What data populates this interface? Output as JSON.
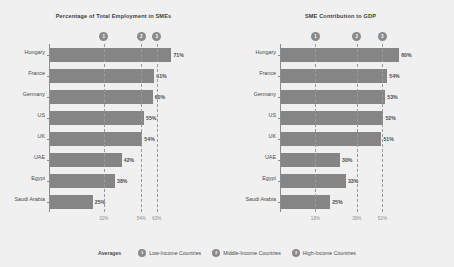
{
  "colors": {
    "background": "#f0f0f0",
    "bar": "#858585",
    "badge": "#8a8a8a",
    "axis": "#8c8c8c",
    "grid": "#9a9a9a",
    "text": "#4a4a4a",
    "tick_text": "#8f8f8f"
  },
  "legend": {
    "title": "Averages",
    "items": [
      {
        "marker": "1",
        "label": "Low-Income Countries"
      },
      {
        "marker": "2",
        "label": "Middle-Income Countries"
      },
      {
        "marker": "3",
        "label": "High-Income Countries"
      }
    ]
  },
  "chart_data": [
    {
      "type": "bar",
      "orientation": "horizontal",
      "title": "Percentage of Total Employment in SMEs",
      "xlabel": "",
      "ylabel": "",
      "xlim": [
        0,
        76
      ],
      "grid": true,
      "legend_position": "bottom",
      "categories": [
        "Hungary",
        "France",
        "Germany",
        "US",
        "UK",
        "UAE",
        "Egypt",
        "Saudi Arabia"
      ],
      "values": [
        71,
        61,
        60,
        55,
        54,
        42,
        38,
        25
      ],
      "value_labels": [
        "71%",
        "61%",
        "60%",
        "55%",
        "54%",
        "42%",
        "38%",
        "25%"
      ],
      "reference_lines": [
        {
          "value": 32,
          "tick_label": "32%",
          "marker": "1"
        },
        {
          "value": 54,
          "tick_label": "54%",
          "marker": "2"
        },
        {
          "value": 63,
          "tick_label": "63%",
          "marker": "3"
        }
      ]
    },
    {
      "type": "bar",
      "orientation": "horizontal",
      "title": "SME Contribution to GDP",
      "xlabel": "",
      "ylabel": "",
      "xlim": [
        0,
        64
      ],
      "grid": true,
      "legend_position": "bottom",
      "categories": [
        "Hungary",
        "France",
        "Germany",
        "US",
        "UK",
        "UAE",
        "Egypt",
        "Saudi Arabia"
      ],
      "values": [
        60,
        54,
        53,
        52,
        51,
        30,
        33,
        25
      ],
      "value_labels": [
        "60%",
        "54%",
        "53%",
        "52%",
        "51%",
        "30%",
        "33%",
        "25%"
      ],
      "reference_lines": [
        {
          "value": 18,
          "tick_label": "18%",
          "marker": "1"
        },
        {
          "value": 39,
          "tick_label": "39%",
          "marker": "2"
        },
        {
          "value": 52,
          "tick_label": "52%",
          "marker": "3"
        }
      ]
    }
  ]
}
